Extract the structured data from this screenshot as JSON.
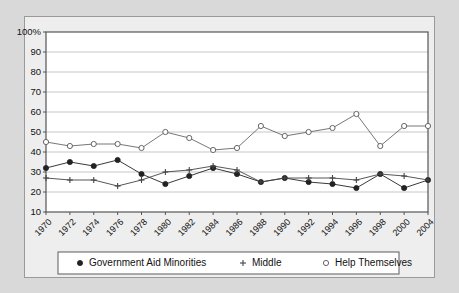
{
  "chart_data": {
    "type": "line",
    "title": "",
    "xlabel": "",
    "ylabel": "",
    "ylim": [
      10,
      100
    ],
    "ytick_values": [
      100,
      90,
      80,
      70,
      60,
      50,
      40,
      30,
      20,
      10
    ],
    "ytick_labels": [
      "100%",
      "90",
      "80",
      "70",
      "60",
      "50",
      "40",
      "30",
      "20",
      "10"
    ],
    "grid": true,
    "legend_position": "bottom",
    "categories": [
      "1970",
      "1972",
      "1974",
      "1976",
      "1978",
      "1980",
      "1982",
      "1984",
      "1986",
      "1988",
      "1990",
      "1992",
      "1994",
      "1996",
      "1998",
      "2000",
      "2004"
    ],
    "series": [
      {
        "name": "Government Aid Minorities",
        "marker": "filled-circle",
        "color": "#222222",
        "values": [
          32,
          35,
          33,
          36,
          29,
          24,
          28,
          32,
          29,
          25,
          27,
          25,
          24,
          22,
          29,
          22,
          26
        ]
      },
      {
        "name": "Middle",
        "marker": "plus",
        "color": "#444444",
        "values": [
          27,
          26,
          26,
          23,
          26,
          30,
          31,
          33,
          31,
          25,
          27,
          27,
          27,
          26,
          29,
          28,
          26
        ]
      },
      {
        "name": "Help Themselves",
        "marker": "open-circle",
        "color": "#666666",
        "values": [
          45,
          43,
          44,
          44,
          42,
          50,
          47,
          41,
          42,
          53,
          48,
          50,
          52,
          59,
          43,
          53,
          53
        ]
      }
    ]
  },
  "legend": {
    "items": [
      {
        "label": "Government Aid Minorities",
        "marker": "filled-circle"
      },
      {
        "label": "Middle",
        "marker": "plus"
      },
      {
        "label": "Help Themselves",
        "marker": "open-circle"
      }
    ]
  }
}
